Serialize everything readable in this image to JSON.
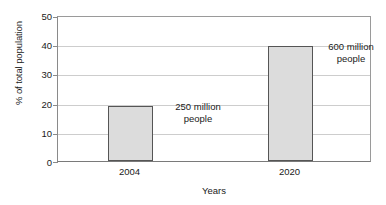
{
  "chart_data": {
    "type": "bar",
    "title": "",
    "xlabel": "Years",
    "ylabel": "% of total population",
    "categories": [
      "2004",
      "2020"
    ],
    "values": [
      19,
      40
    ],
    "ylim": [
      0,
      50
    ],
    "yticks": [
      "0",
      "10",
      "20",
      "30",
      "40",
      "50"
    ],
    "grid": true,
    "legend": "none",
    "bar_color": "#dcdcdc",
    "bar_edge_color": "#555555",
    "annotations": [
      {
        "text": "250 million\npeople",
        "category": "2004"
      },
      {
        "text": "600 million\npeople",
        "category": "2020"
      }
    ]
  }
}
